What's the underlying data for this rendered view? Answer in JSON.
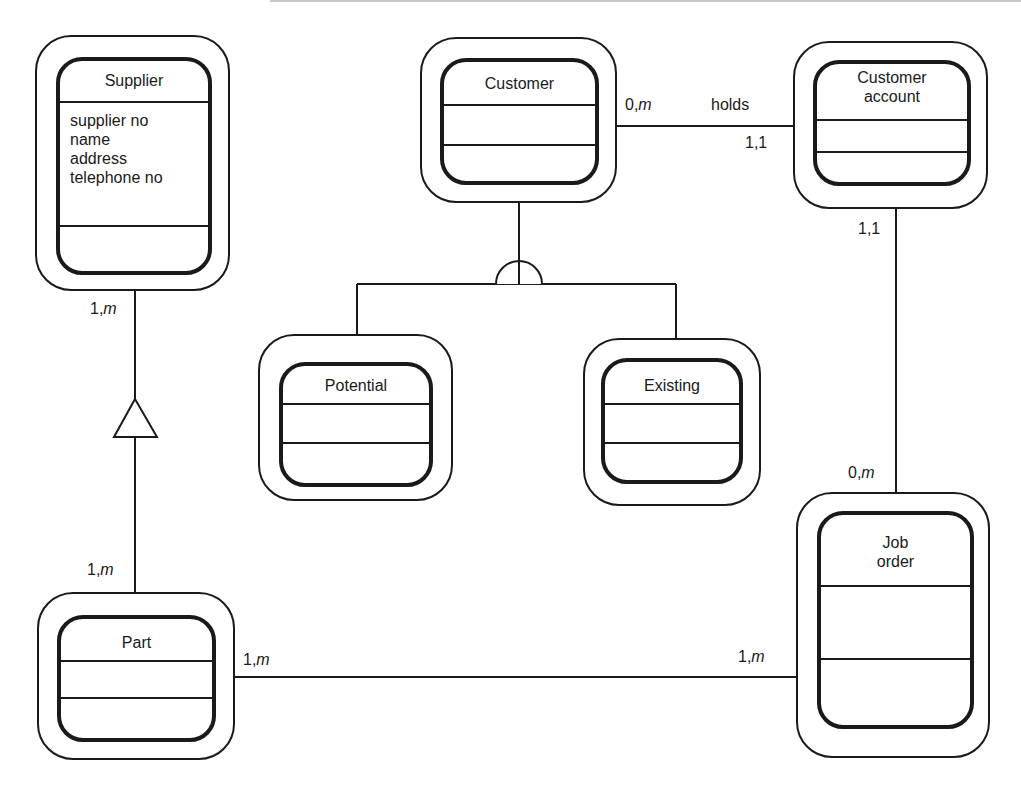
{
  "diagram": {
    "type": "entity-relationship",
    "entities": [
      {
        "id": "supplier",
        "name": "Supplier",
        "attributes": [
          "supplier no",
          "name",
          "address",
          "telephone no"
        ]
      },
      {
        "id": "customer",
        "name": "Customer",
        "attributes": []
      },
      {
        "id": "customer_account",
        "name": "Customer account",
        "name_lines": [
          "Customer",
          "account"
        ],
        "attributes": []
      },
      {
        "id": "potential",
        "name": "Potential",
        "attributes": []
      },
      {
        "id": "existing",
        "name": "Existing",
        "attributes": []
      },
      {
        "id": "job_order",
        "name": "Job order",
        "name_lines": [
          "Job",
          "order"
        ],
        "attributes": []
      },
      {
        "id": "part",
        "name": "Part",
        "attributes": []
      }
    ],
    "relationships": [
      {
        "from": "customer",
        "to": "customer_account",
        "label": "holds",
        "from_cardinality": "0,m",
        "to_cardinality": "1,1"
      },
      {
        "from": "customer_account",
        "to": "job_order",
        "from_cardinality": "1,1",
        "to_cardinality": "0,m"
      },
      {
        "from": "supplier",
        "to": "part",
        "from_cardinality": "1,m",
        "to_cardinality": "1,m",
        "symbol": "triangle"
      },
      {
        "from": "part",
        "to": "job_order",
        "from_cardinality": "1,m",
        "to_cardinality": "1,m"
      }
    ],
    "generalization": {
      "parent": "customer",
      "children": [
        "potential",
        "existing"
      ],
      "symbol": "semicircle"
    },
    "cardinality_labels": {
      "customer_holds": {
        "num": "0,",
        "var": "m"
      },
      "holds": "holds",
      "account_holds": "1,1",
      "account_job": "1,1",
      "job_account": {
        "num": "0,",
        "var": "m"
      },
      "supplier_part": {
        "num": "1,",
        "var": "m"
      },
      "part_supplier": {
        "num": "1,",
        "var": "m"
      },
      "part_job": {
        "num": "1,",
        "var": "m"
      },
      "job_part": {
        "num": "1,",
        "var": "m"
      }
    }
  }
}
